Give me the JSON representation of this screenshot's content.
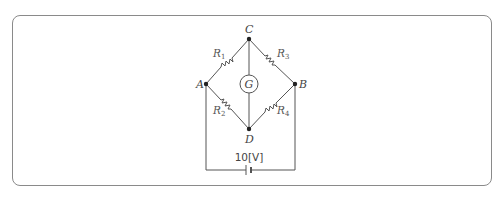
{
  "diagram": {
    "type": "wheatstone-bridge",
    "nodes": {
      "A": {
        "label": "A",
        "x": 206,
        "y": 84
      },
      "B": {
        "label": "B",
        "x": 295,
        "y": 84
      },
      "C": {
        "label": "C",
        "x": 249,
        "y": 39
      },
      "D": {
        "label": "D",
        "x": 249,
        "y": 129
      }
    },
    "resistors": [
      {
        "id": "R1",
        "label": "R",
        "subscript": "1",
        "from": "A",
        "to": "C"
      },
      {
        "id": "R3",
        "label": "R",
        "subscript": "3",
        "from": "C",
        "to": "B"
      },
      {
        "id": "R2",
        "label": "R",
        "subscript": "2",
        "from": "A",
        "to": "D"
      },
      {
        "id": "R4",
        "label": "R",
        "subscript": "4",
        "from": "D",
        "to": "B"
      }
    ],
    "galvanometer": {
      "label": "G",
      "between": [
        "C",
        "D"
      ]
    },
    "battery": {
      "label": "10[V]",
      "between": [
        "A",
        "B"
      ]
    },
    "colors": {
      "wire": "#555555",
      "frame": "#8a8a8a",
      "text": "#444444"
    }
  }
}
